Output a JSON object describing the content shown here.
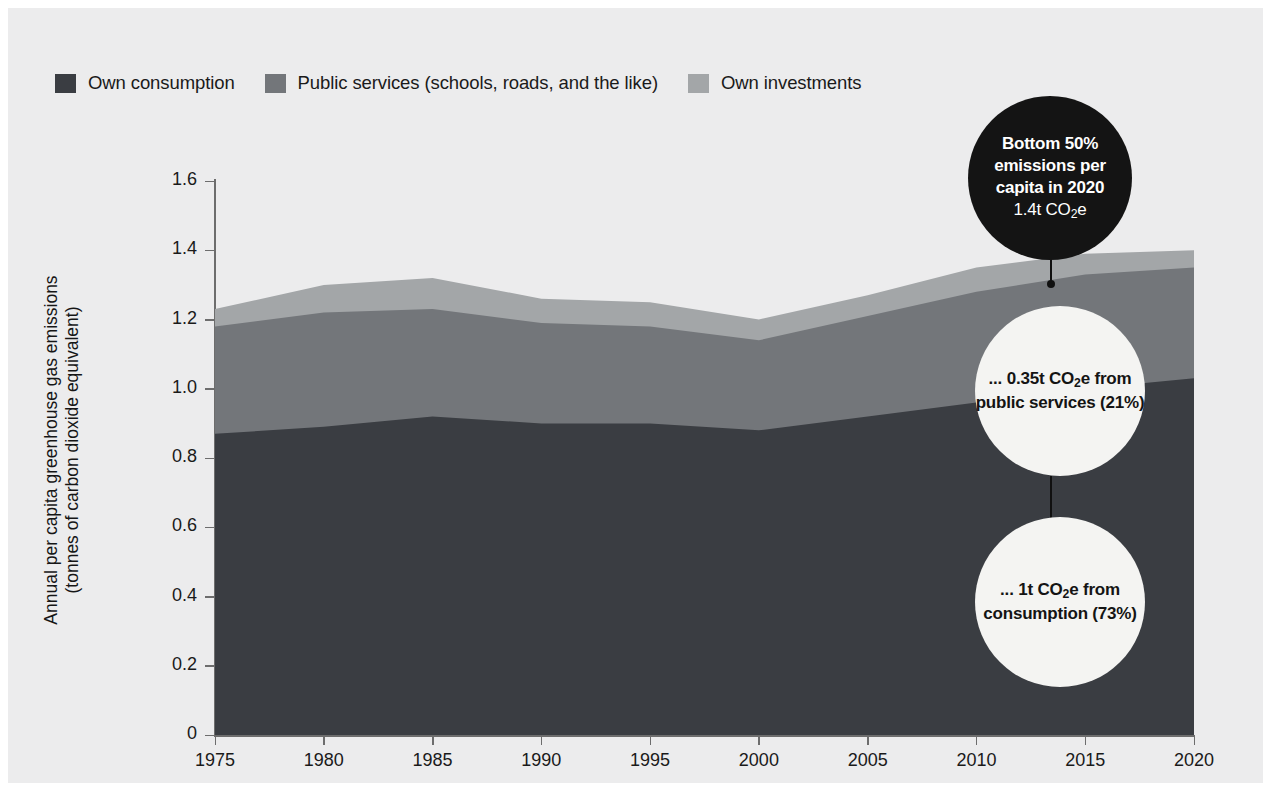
{
  "legend": {
    "items": [
      {
        "label": "Own consumption",
        "color": "#3a3d42",
        "name": "legend-own-consumption"
      },
      {
        "label": "Public services (schools, roads, and the like)",
        "color": "#73767a",
        "name": "legend-public-services"
      },
      {
        "label": "Own investments",
        "color": "#a3a6a8",
        "name": "legend-own-investments"
      }
    ]
  },
  "axes": {
    "ylabel_line1": "Annual per capita greenhouse gas emissions",
    "ylabel_line2": "(tonnes of carbon dioxide equivalent)",
    "yticks": [
      "1.6",
      "1.4",
      "1.2",
      "1.0",
      "0.8",
      "0.6",
      "0.4",
      "0.2",
      "0"
    ],
    "xticks": [
      "1975",
      "1980",
      "1985",
      "1990",
      "1995",
      "2000",
      "2005",
      "2010",
      "2015",
      "2020"
    ]
  },
  "annotations": [
    {
      "name": "bubble-total-2020",
      "style": "dark",
      "title": "Bottom 50% emissions per capita in 2020",
      "sub": "1.4t CO₂e"
    },
    {
      "name": "bubble-public-services",
      "style": "light",
      "title": "... 0.35t CO₂e from public services (21%)",
      "sub": ""
    },
    {
      "name": "bubble-consumption",
      "style": "light",
      "title": "... 1t CO₂e from consumption (73%)",
      "sub": ""
    }
  ],
  "chart_data": {
    "type": "area",
    "title": "",
    "xlabel": "",
    "ylabel": "Annual per capita greenhouse gas emissions (tonnes of carbon dioxide equivalent)",
    "xlim": [
      1975,
      2020
    ],
    "ylim": [
      0,
      1.6
    ],
    "grid": false,
    "legend_position": "top-left",
    "stacked": true,
    "x": [
      1975,
      1980,
      1985,
      1990,
      1995,
      2000,
      2005,
      2010,
      2015,
      2020
    ],
    "series": [
      {
        "name": "Own consumption",
        "color": "#3a3d42",
        "values": [
          0.87,
          0.89,
          0.92,
          0.9,
          0.9,
          0.88,
          0.92,
          0.96,
          1.0,
          1.03
        ]
      },
      {
        "name": "Public services (schools, roads, and the like)",
        "color": "#73767a",
        "values": [
          0.31,
          0.33,
          0.31,
          0.29,
          0.28,
          0.26,
          0.29,
          0.32,
          0.33,
          0.32
        ]
      },
      {
        "name": "Own investments",
        "color": "#a3a6a8",
        "values": [
          0.05,
          0.08,
          0.09,
          0.07,
          0.07,
          0.06,
          0.06,
          0.07,
          0.06,
          0.05
        ]
      }
    ],
    "totals": [
      1.23,
      1.3,
      1.32,
      1.26,
      1.25,
      1.2,
      1.27,
      1.35,
      1.39,
      1.4
    ]
  }
}
